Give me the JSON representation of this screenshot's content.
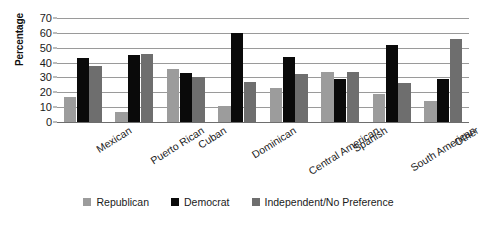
{
  "chart_data": {
    "type": "bar",
    "title": "",
    "xlabel": "",
    "ylabel": "Percentage",
    "ylim": [
      0,
      70
    ],
    "ytick_step": 10,
    "yticks": [
      0,
      10,
      20,
      30,
      40,
      50,
      60,
      70
    ],
    "grid": true,
    "legend_position": "bottom",
    "categories": [
      "Mexican",
      "Puerto Rican",
      "Cuban",
      "Dominican",
      "Central American",
      "Spanish",
      "South American",
      "Other"
    ],
    "series": [
      {
        "name": "Republican",
        "color": "#9c9c9c",
        "values": [
          17,
          7,
          36,
          11,
          23,
          34,
          19,
          14
        ]
      },
      {
        "name": "Democrat",
        "color": "#0a0a0a",
        "values": [
          43,
          45,
          33,
          60,
          44,
          29,
          52,
          29
        ]
      },
      {
        "name": "Independent/No Preference",
        "color": "#6e6e6e",
        "values": [
          38,
          46,
          30,
          27,
          32,
          34,
          26,
          56
        ]
      }
    ]
  },
  "axis": {
    "y_title": "Percentage"
  },
  "legend": {
    "items": [
      {
        "label": "Republican",
        "key": "republican"
      },
      {
        "label": "Democrat",
        "key": "democrat"
      },
      {
        "label": "Independent/No Preference",
        "key": "independent"
      }
    ]
  }
}
